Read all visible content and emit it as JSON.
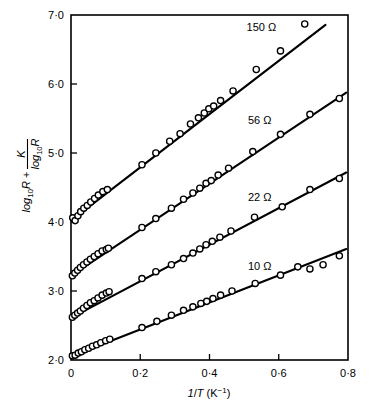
{
  "chart_data": {
    "type": "scatter",
    "title": "",
    "subtitle": "",
    "xlabel": "1/T (K⁻¹)",
    "ylabel": "log₁₀R + K/log₁₀R",
    "ylabel_parts": {
      "base": "log",
      "base_sub": "10",
      "base_var": "R",
      "plus": "+",
      "frac_numerator": "K",
      "frac_denominator_text": "log",
      "frac_denominator_sub": "10",
      "frac_denominator_var": "R"
    },
    "xlim": [
      0,
      0.8
    ],
    "ylim": [
      2.0,
      7.0
    ],
    "xticks": [
      0,
      0.2,
      0.4,
      0.6,
      0.8
    ],
    "xtick_labels": [
      "0",
      "0·2",
      "0·4",
      "0·6",
      "0·8"
    ],
    "yticks": [
      2.0,
      3.0,
      4.0,
      5.0,
      6.0,
      7.0
    ],
    "ytick_labels": [
      "2·0",
      "3·0",
      "4·0",
      "5·0",
      "6·0",
      "7·0"
    ],
    "grid": false,
    "legend_position": "inline-annotations",
    "marker_style": "open-circle",
    "line_color": "#000000",
    "marker_fill": "#ffffff",
    "marker_edge": "#000000",
    "series": [
      {
        "name": "150 Ω",
        "label": "150 Ω",
        "label_x": 0.55,
        "label_y": 6.82,
        "fit_intercept": 4.02,
        "fit_slope": 3.86,
        "fit_x_start": 0.0,
        "fit_x_end": 0.735,
        "x": [
          0.005,
          0.012,
          0.02,
          0.028,
          0.037,
          0.047,
          0.057,
          0.068,
          0.079,
          0.092,
          0.105,
          0.205,
          0.245,
          0.285,
          0.315,
          0.345,
          0.368,
          0.385,
          0.398,
          0.412,
          0.432,
          0.468,
          0.535,
          0.605,
          0.675
        ],
        "y": [
          4.06,
          4.02,
          4.09,
          4.15,
          4.2,
          4.24,
          4.29,
          4.34,
          4.39,
          4.44,
          4.47,
          4.83,
          5.0,
          5.17,
          5.28,
          5.42,
          5.51,
          5.58,
          5.64,
          5.68,
          5.76,
          5.9,
          6.21,
          6.48,
          6.87
        ]
      },
      {
        "name": "56 Ω",
        "label": "56 Ω",
        "label_x": 0.545,
        "label_y": 5.48,
        "fit_intercept": 3.22,
        "fit_slope": 3.34,
        "fit_x_start": 0.0,
        "fit_x_end": 0.795,
        "x": [
          0.004,
          0.011,
          0.019,
          0.027,
          0.036,
          0.046,
          0.056,
          0.067,
          0.078,
          0.09,
          0.102,
          0.108,
          0.205,
          0.245,
          0.29,
          0.325,
          0.352,
          0.372,
          0.39,
          0.405,
          0.425,
          0.455,
          0.525,
          0.605,
          0.69,
          0.775
        ],
        "y": [
          3.22,
          3.26,
          3.3,
          3.34,
          3.38,
          3.42,
          3.46,
          3.5,
          3.54,
          3.58,
          3.6,
          3.62,
          3.92,
          4.05,
          4.2,
          4.33,
          4.42,
          4.49,
          4.56,
          4.6,
          4.68,
          4.78,
          5.02,
          5.27,
          5.56,
          5.79
        ]
      },
      {
        "name": "22 Ω",
        "label": "22 Ω",
        "label_x": 0.545,
        "label_y": 4.36,
        "fit_intercept": 2.61,
        "fit_slope": 2.65,
        "fit_x_start": 0.0,
        "fit_x_end": 0.795,
        "x": [
          0.004,
          0.011,
          0.019,
          0.027,
          0.036,
          0.046,
          0.056,
          0.067,
          0.078,
          0.09,
          0.102,
          0.11,
          0.205,
          0.245,
          0.29,
          0.325,
          0.352,
          0.372,
          0.39,
          0.408,
          0.43,
          0.462,
          0.53,
          0.61,
          0.69,
          0.775
        ],
        "y": [
          2.62,
          2.65,
          2.68,
          2.71,
          2.75,
          2.79,
          2.83,
          2.86,
          2.9,
          2.94,
          2.97,
          2.99,
          3.18,
          3.28,
          3.38,
          3.47,
          3.55,
          3.61,
          3.67,
          3.72,
          3.78,
          3.87,
          4.07,
          4.22,
          4.47,
          4.63
        ]
      },
      {
        "name": "10 Ω",
        "label": "10 Ω",
        "label_x": 0.545,
        "label_y": 3.36,
        "fit_intercept": 2.05,
        "fit_slope": 1.96,
        "fit_x_start": 0.0,
        "fit_x_end": 0.795,
        "x": [
          0.004,
          0.012,
          0.021,
          0.03,
          0.04,
          0.051,
          0.062,
          0.074,
          0.086,
          0.1,
          0.112,
          0.205,
          0.248,
          0.29,
          0.325,
          0.352,
          0.375,
          0.392,
          0.41,
          0.432,
          0.465,
          0.532,
          0.605,
          0.655,
          0.69,
          0.728,
          0.775
        ],
        "y": [
          2.06,
          2.07,
          2.1,
          2.12,
          2.15,
          2.17,
          2.2,
          2.22,
          2.25,
          2.28,
          2.3,
          2.47,
          2.56,
          2.65,
          2.72,
          2.77,
          2.82,
          2.85,
          2.89,
          2.94,
          3.0,
          3.11,
          3.23,
          3.35,
          3.32,
          3.38,
          3.51
        ]
      }
    ]
  }
}
